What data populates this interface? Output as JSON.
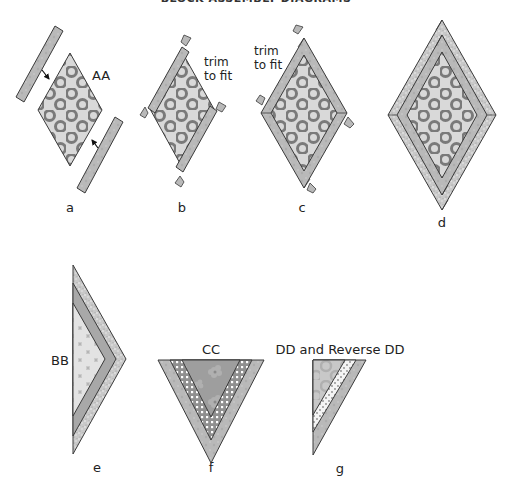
{
  "heading": "BLOCK ASSEMBLY DIAGRAMS",
  "colors": {
    "background": "#ffffff",
    "outline": "#3a3a3a",
    "strip_fill": "#b9b9b9",
    "center_fill": "#d9d9d9",
    "ring_color": "#7a7a7a",
    "speckle_fill": "#cfcfcf",
    "dark_fill": "#a8a8a8",
    "floral_fill": "#9e9e9e",
    "dots_fill": "#8f8f8f"
  },
  "diagrams": [
    {
      "id": "a",
      "label": "a",
      "annotation": "AA"
    },
    {
      "id": "b",
      "label": "b",
      "annotation": "trim to fit",
      "annotation_lines": [
        "trim",
        "to fit"
      ]
    },
    {
      "id": "c",
      "label": "c",
      "annotation": "trim to fit",
      "annotation_lines": [
        "trim",
        "to fit"
      ]
    },
    {
      "id": "d",
      "label": "d"
    },
    {
      "id": "e",
      "label": "e",
      "annotation": "BB"
    },
    {
      "id": "f",
      "label": "f",
      "annotation": "CC"
    },
    {
      "id": "g",
      "label": "g",
      "annotation": "DD and Reverse DD"
    }
  ]
}
